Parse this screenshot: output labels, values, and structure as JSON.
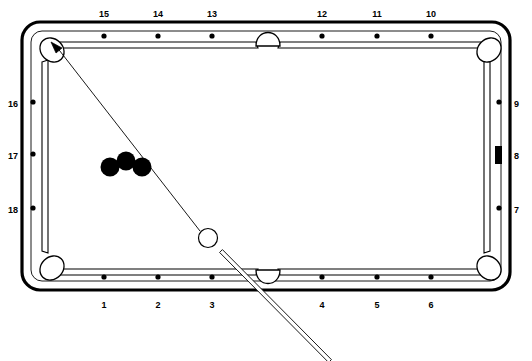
{
  "diagram": {
    "type": "pool-table-shot-diagram",
    "colors": {
      "frame": "#000000",
      "cloth": "#ffffff",
      "object_ball": "#000000",
      "cue_ball_fill": "#ffffff",
      "cue_ball_stroke": "#000000",
      "marker": "#000000",
      "aim_line": "#000000"
    },
    "table": {
      "outer": {
        "x": 22,
        "y": 22,
        "width": 488,
        "height": 268,
        "corner_radius": 18
      },
      "rail_inner": {
        "x": 40,
        "y": 38,
        "width": 452,
        "height": 236
      },
      "cloth": {
        "x": 47,
        "y": 45,
        "width": 438,
        "height": 222
      }
    },
    "diamond_labels": {
      "top": [
        {
          "text": "15",
          "x": 104,
          "y": 9
        },
        {
          "text": "14",
          "x": 158,
          "y": 9
        },
        {
          "text": "13",
          "x": 212,
          "y": 9
        },
        {
          "text": "12",
          "x": 322,
          "y": 9
        },
        {
          "text": "11",
          "x": 377,
          "y": 9
        },
        {
          "text": "10",
          "x": 431,
          "y": 9
        }
      ],
      "bottom": [
        {
          "text": "1",
          "x": 104,
          "y": 300
        },
        {
          "text": "2",
          "x": 158,
          "y": 300
        },
        {
          "text": "3",
          "x": 212,
          "y": 300
        },
        {
          "text": "4",
          "x": 322,
          "y": 300
        },
        {
          "text": "5",
          "x": 377,
          "y": 300
        },
        {
          "text": "6",
          "x": 431,
          "y": 300
        }
      ],
      "left": [
        {
          "text": "16",
          "x": 2,
          "y": 99
        },
        {
          "text": "17",
          "x": 2,
          "y": 151
        },
        {
          "text": "18",
          "x": 2,
          "y": 205
        }
      ],
      "right": [
        {
          "text": "9",
          "x": 514,
          "y": 99
        },
        {
          "text": "8",
          "x": 514,
          "y": 151
        },
        {
          "text": "7",
          "x": 514,
          "y": 205
        }
      ]
    },
    "diamond_dots": {
      "top_y": 36,
      "bottom_y": 277,
      "left_x": 33,
      "right_x": 499,
      "top_x": [
        104,
        158,
        212,
        322,
        377,
        431
      ],
      "bottom_x": [
        104,
        158,
        212,
        322,
        377,
        431
      ],
      "left_y": [
        102,
        154,
        208
      ],
      "right_y": [
        102,
        208
      ]
    },
    "rail_marker": {
      "name": "target-diamond-marker",
      "shape": "rectangle",
      "x": 495,
      "y": 146,
      "width": 7,
      "height": 18,
      "diamond_number": "8"
    },
    "pockets": [
      {
        "name": "pocket-top-left",
        "type": "corner",
        "cx": 52,
        "cy": 50,
        "rx": 11,
        "ry": 13,
        "rotate": -45
      },
      {
        "name": "pocket-top-side",
        "type": "side",
        "cx": 268,
        "cy": 39,
        "rx": 12,
        "ry": 11
      },
      {
        "name": "pocket-top-right",
        "type": "corner",
        "cx": 489,
        "cy": 50,
        "rx": 11,
        "ry": 13,
        "rotate": 45
      },
      {
        "name": "pocket-bottom-left",
        "type": "corner",
        "cx": 52,
        "cy": 268,
        "rx": 11,
        "ry": 13,
        "rotate": 45
      },
      {
        "name": "pocket-bottom-side",
        "type": "side",
        "cx": 268,
        "cy": 276,
        "rx": 12,
        "ry": 11
      },
      {
        "name": "pocket-bottom-right",
        "type": "corner",
        "cx": 489,
        "cy": 268,
        "rx": 11,
        "ry": 13,
        "rotate": -45
      }
    ],
    "object_balls": [
      {
        "name": "object-ball-left",
        "cx": 110,
        "cy": 167,
        "r": 9.5,
        "color": "#000000"
      },
      {
        "name": "object-ball-middle",
        "cx": 126,
        "cy": 161,
        "r": 9.5,
        "color": "#000000"
      },
      {
        "name": "object-ball-right",
        "cx": 142,
        "cy": 167,
        "r": 9.5,
        "color": "#000000"
      }
    ],
    "cue_ball": {
      "name": "cue-ball",
      "cx": 208,
      "cy": 238,
      "r": 9.5
    },
    "aim_line": {
      "name": "aim-line",
      "from": {
        "x": 200,
        "y": 231
      },
      "to": {
        "x": 56,
        "y": 46
      },
      "arrow_tip": {
        "x": 51,
        "y": 42
      }
    },
    "cue_stick": {
      "name": "cue-stick",
      "tip": {
        "x": 221,
        "y": 251
      },
      "butt": {
        "x": 330,
        "y": 361
      },
      "width": 4
    }
  }
}
